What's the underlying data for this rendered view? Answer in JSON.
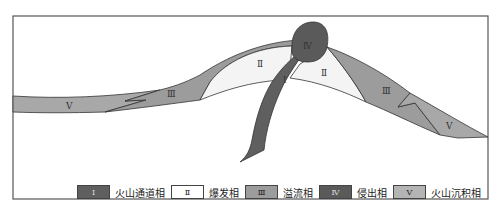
{
  "diagram": {
    "title": "",
    "facies": [
      {
        "id": "I",
        "numeral": "Ⅰ",
        "label": "火山通道相",
        "color": "#5f5f5f"
      },
      {
        "id": "II",
        "numeral": "Ⅱ",
        "label": "爆发相",
        "color": "#f4f4f4"
      },
      {
        "id": "III",
        "numeral": "Ⅲ",
        "label": "溢流相",
        "color": "#9c9c9c"
      },
      {
        "id": "IV",
        "numeral": "Ⅳ",
        "label": "侵出相",
        "color": "#5a5a5a"
      },
      {
        "id": "V",
        "numeral": "Ⅴ",
        "label": "火山沉积相",
        "color": "#a8a8a8"
      }
    ],
    "labels_on_figure": {
      "left_v": "V",
      "left_iii": "Ⅲ",
      "left_ii": "Ⅱ",
      "conduit_i": "Ⅰ",
      "crater_iv": "Ⅳ",
      "right_ii": "Ⅱ",
      "right_iii": "Ⅲ",
      "right_v": "V"
    }
  },
  "legend": {
    "items": [
      {
        "numeral": "Ⅰ",
        "label": "火山通道相"
      },
      {
        "numeral": "Ⅱ",
        "label": "爆发相"
      },
      {
        "numeral": "Ⅲ",
        "label": "溢流相"
      },
      {
        "numeral": "Ⅳ",
        "label": "侵出相"
      },
      {
        "numeral": "Ⅴ",
        "label": "火山沉积相"
      }
    ]
  }
}
